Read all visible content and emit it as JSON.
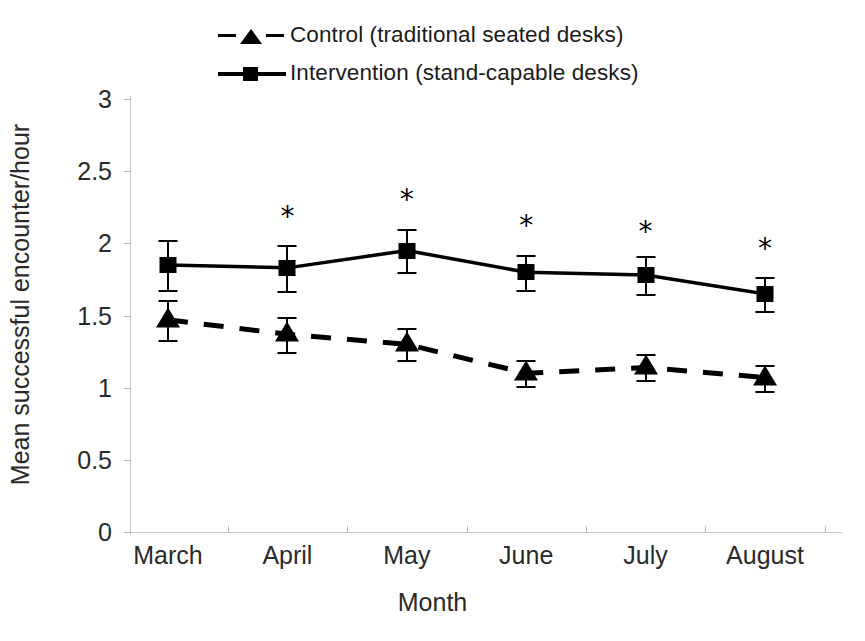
{
  "chart_data": {
    "type": "line",
    "title": "",
    "xlabel": "Month",
    "ylabel": "Mean successful encounter/hour",
    "categories": [
      "March",
      "April",
      "May",
      "June",
      "July",
      "August"
    ],
    "ylim": [
      0,
      3
    ],
    "yticks": [
      0,
      0.5,
      1,
      1.5,
      2,
      2.5,
      3
    ],
    "ytick_labels": [
      "0",
      "0.5",
      "1",
      "1.5",
      "2",
      "2.5",
      "3"
    ],
    "grid": false,
    "legend_position": "top",
    "series": [
      {
        "name": "Control (traditional seated desks)",
        "marker": "triangle",
        "linestyle": "dashed",
        "color": "#000000",
        "values": [
          1.47,
          1.37,
          1.3,
          1.1,
          1.14,
          1.07
        ],
        "errors": [
          0.14,
          0.12,
          0.11,
          0.09,
          0.09,
          0.09
        ]
      },
      {
        "name": "Intervention (stand-capable desks)",
        "marker": "square",
        "linestyle": "solid",
        "color": "#000000",
        "values": [
          1.85,
          1.83,
          1.95,
          1.8,
          1.78,
          1.65
        ],
        "errors": [
          0.17,
          0.16,
          0.15,
          0.12,
          0.13,
          0.12
        ]
      }
    ],
    "annotations": [
      {
        "label": "*",
        "category": "April",
        "value": 2.18
      },
      {
        "label": "*",
        "category": "May",
        "value": 2.3
      },
      {
        "label": "*",
        "category": "June",
        "value": 2.12
      },
      {
        "label": "*",
        "category": "July",
        "value": 2.08
      },
      {
        "label": "*",
        "category": "August",
        "value": 1.96
      }
    ]
  },
  "legend": {
    "items": [
      {
        "label": "Control (traditional seated desks)",
        "marker": "triangle",
        "style": "dashed"
      },
      {
        "label": "Intervention (stand-capable desks)",
        "marker": "square",
        "style": "solid"
      }
    ]
  },
  "axes": {
    "y_title": "Mean successful encounter/hour",
    "x_title": "Month"
  }
}
